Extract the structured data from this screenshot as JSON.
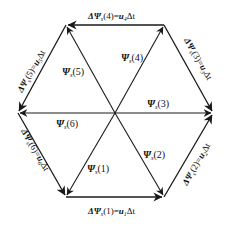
{
  "diagram": {
    "type": "hexagon-flux-vector-diagram",
    "colors": {
      "line": "#1a1a1a",
      "text": "#111111",
      "background": "#ffffff"
    },
    "center": {
      "x": 115,
      "y": 113
    },
    "vertices": {
      "v1": {
        "x": 66,
        "y": 197
      },
      "v2": {
        "x": 164,
        "y": 197
      },
      "v3": {
        "x": 213,
        "y": 113
      },
      "v4": {
        "x": 164,
        "y": 25
      },
      "v5": {
        "x": 66,
        "y": 25
      },
      "v6": {
        "x": 18,
        "y": 113
      }
    },
    "flux_vectors": [
      {
        "id": "psi1",
        "symbol": "Ψ",
        "sub": "s",
        "index": "(1)",
        "from": "center",
        "to": "v1"
      },
      {
        "id": "psi2",
        "symbol": "Ψ",
        "sub": "s",
        "index": "(2)",
        "from": "center",
        "to": "v2"
      },
      {
        "id": "psi3",
        "symbol": "Ψ",
        "sub": "s",
        "index": "(3)",
        "from": "center",
        "to": "v3"
      },
      {
        "id": "psi4",
        "symbol": "Ψ",
        "sub": "s",
        "index": "(4)",
        "from": "center",
        "to": "v4"
      },
      {
        "id": "psi5",
        "symbol": "Ψ",
        "sub": "s",
        "index": "(5)",
        "from": "center",
        "to": "v5"
      },
      {
        "id": "psi6",
        "symbol": "Ψ",
        "sub": "s",
        "index": "(6)",
        "from": "center",
        "to": "v6"
      }
    ],
    "delta_vectors": [
      {
        "id": "d1",
        "prefix": "ΔΨ",
        "sub": "s",
        "index": "(1)",
        "eq": "=",
        "u": "u",
        "usub": "1",
        "dt": "Δt",
        "from": "v1",
        "to": "v2"
      },
      {
        "id": "d2",
        "prefix": "ΔΨ",
        "sub": "s",
        "index": "(2)",
        "eq": "=",
        "u": "u",
        "usub": "2",
        "dt": "Δt",
        "from": "v2",
        "to": "v3"
      },
      {
        "id": "d3",
        "prefix": "ΔΨ",
        "sub": "s",
        "index": "(3)",
        "eq": "=",
        "u": "u",
        "usub": "3",
        "dt": "Δt",
        "from": "v4",
        "to": "v3"
      },
      {
        "id": "d4",
        "prefix": "ΔΨ",
        "sub": "s",
        "index": "(4)",
        "eq": "=",
        "u": "u",
        "usub": "4",
        "dt": "Δt",
        "from": "v4",
        "to": "v5"
      },
      {
        "id": "d5",
        "prefix": "ΔΨ",
        "sub": "s",
        "index": "(5)",
        "eq": "=",
        "u": "u",
        "usub": "5",
        "dt": "Δt",
        "from": "v5",
        "to": "v6"
      },
      {
        "id": "d6",
        "prefix": "ΔΨ",
        "sub": "s",
        "index": "(6)",
        "eq": "=",
        "u": "u",
        "usub": "6",
        "dt": "Δt",
        "from": "v6",
        "to": "v1"
      }
    ]
  }
}
